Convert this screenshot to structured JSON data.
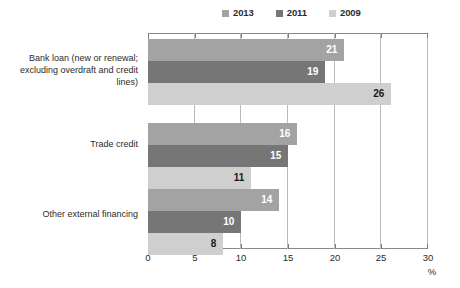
{
  "chart_data": {
    "type": "bar",
    "orientation": "horizontal",
    "title": "",
    "xlabel": "%",
    "ylabel": "",
    "xlim": [
      0,
      30
    ],
    "xticks": [
      0,
      5,
      10,
      15,
      20,
      25,
      30
    ],
    "grid": true,
    "legend_position": "top-center",
    "categories": [
      "Bank loan (new or renewal; excluding overdraft and credit lines)",
      "Trade credit",
      "Other external financing"
    ],
    "series": [
      {
        "name": "2013",
        "color": "#a3a3a3",
        "label_color": "#ffffff",
        "values": [
          21,
          16,
          14
        ]
      },
      {
        "name": "2011",
        "color": "#767676",
        "label_color": "#ffffff",
        "values": [
          19,
          15,
          10
        ]
      },
      {
        "name": "2009",
        "color": "#cfcfcf",
        "label_color": "#1a1a1a",
        "values": [
          26,
          11,
          8
        ]
      }
    ]
  },
  "legend": {
    "items": [
      {
        "label": "2013",
        "color": "#a3a3a3"
      },
      {
        "label": "2011",
        "color": "#767676"
      },
      {
        "label": "2009",
        "color": "#cfcfcf"
      }
    ]
  },
  "axis": {
    "unit": "%",
    "tick_labels": [
      "0",
      "5",
      "10",
      "15",
      "20",
      "25",
      "30"
    ]
  },
  "colors": {
    "series_2013": "#a3a3a3",
    "series_2011": "#767676",
    "series_2009": "#cfcfcf",
    "gridline": "#b9b9b9",
    "axis": "#8a8a8a",
    "text": "#2b2b2b",
    "background": "#ffffff"
  }
}
